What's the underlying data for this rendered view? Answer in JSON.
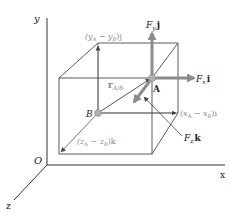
{
  "figure": {
    "axes": {
      "x_label": "x",
      "y_label": "y",
      "z_label": "z",
      "origin_label": "O"
    },
    "points": {
      "A": "A",
      "B": "B"
    },
    "vectors": {
      "r_ab": {
        "main": "r",
        "sub": "A/B"
      },
      "Fx": {
        "main": "F",
        "sub": "x",
        "unit": "i"
      },
      "Fy": {
        "main": "F",
        "sub": "y",
        "unit": "j"
      },
      "Fz": {
        "main": "F",
        "sub": "z",
        "unit": "k"
      }
    },
    "components": {
      "x": "(xₐ − xʙ)i",
      "x_parts": {
        "open": "(x",
        "sub1": "A",
        "mid": " − x",
        "sub2": "B",
        "close": ")i"
      },
      "y_parts": {
        "open": "(y",
        "sub1": "A",
        "mid": " − y",
        "sub2": "B",
        "close": ")j"
      },
      "z_parts": {
        "open": "(z",
        "sub1": "A",
        "mid": " − z",
        "sub2": "B",
        "close": ")k"
      }
    },
    "colors": {
      "line": "#333333",
      "vector": "#8c8c8c",
      "component_text": "#8a8a8a",
      "point": "#b0b0b0"
    }
  }
}
